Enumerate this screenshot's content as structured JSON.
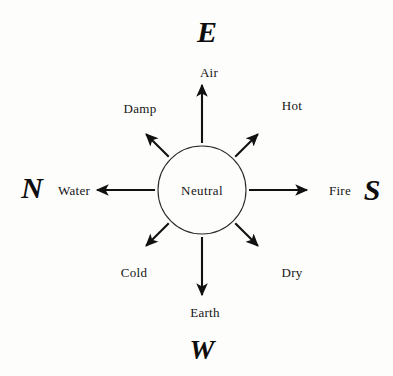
{
  "diagram": {
    "background_color": "#fdfdfc",
    "stroke_color": "#111111",
    "center": {
      "label": "Neutral",
      "cx": 202,
      "cy": 190,
      "r": 44
    },
    "cardinal_letters": [
      {
        "name": "east",
        "letter": "E",
        "x": 207,
        "y": 32
      },
      {
        "name": "south",
        "letter": "S",
        "x": 372,
        "y": 190
      },
      {
        "name": "west",
        "letter": "W",
        "x": 202,
        "y": 350
      },
      {
        "name": "north",
        "letter": "N",
        "x": 32,
        "y": 188
      }
    ],
    "spokes": [
      {
        "name": "air",
        "label": "Air",
        "angle_deg": 270,
        "label_x": 209,
        "label_y": 72,
        "tip_len": 105
      },
      {
        "name": "hot",
        "label": "Hot",
        "angle_deg": 315,
        "label_x": 292,
        "label_y": 105,
        "tip_len": 79
      },
      {
        "name": "fire",
        "label": "Fire",
        "angle_deg": 0,
        "label_x": 340,
        "label_y": 190,
        "tip_len": 105
      },
      {
        "name": "dry",
        "label": "Dry",
        "angle_deg": 45,
        "label_x": 292,
        "label_y": 272,
        "tip_len": 79
      },
      {
        "name": "earth",
        "label": "Earth",
        "angle_deg": 90,
        "label_x": 205,
        "label_y": 312,
        "tip_len": 105
      },
      {
        "name": "cold",
        "label": "Cold",
        "angle_deg": 135,
        "label_x": 134,
        "label_y": 272,
        "tip_len": 79
      },
      {
        "name": "water",
        "label": "Water",
        "angle_deg": 180,
        "label_x": 74,
        "label_y": 190,
        "tip_len": 105
      },
      {
        "name": "damp",
        "label": "Damp",
        "angle_deg": 225,
        "label_x": 140,
        "label_y": 108,
        "tip_len": 79
      }
    ]
  }
}
